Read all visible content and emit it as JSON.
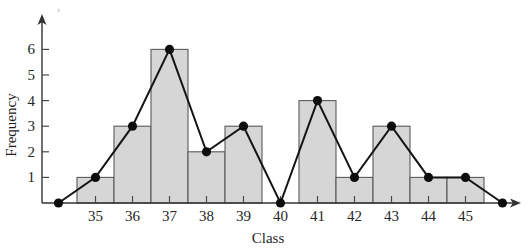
{
  "chart_data": {
    "type": "bar",
    "title": "",
    "xlabel": "Class",
    "ylabel": "Frequency",
    "categories": [
      "35",
      "36",
      "37",
      "38",
      "39",
      "40",
      "41",
      "42",
      "43",
      "44",
      "45"
    ],
    "values": [
      1,
      3,
      6,
      2,
      3,
      0,
      4,
      1,
      3,
      1,
      1
    ],
    "ylim": [
      0,
      7
    ],
    "yticks": [
      "1",
      "2",
      "3",
      "4",
      "5",
      "6"
    ],
    "ytick_values": [
      1,
      2,
      3,
      4,
      5,
      6
    ],
    "grid": false,
    "legend": null,
    "overlay": {
      "type": "line",
      "name": "frequency polygon",
      "x": [
        "34",
        "35",
        "36",
        "37",
        "38",
        "39",
        "40",
        "41",
        "42",
        "43",
        "44",
        "45",
        "46"
      ],
      "values": [
        0,
        1,
        3,
        6,
        2,
        3,
        0,
        4,
        1,
        3,
        1,
        1,
        0
      ],
      "markers": "filled-circle"
    },
    "style": {
      "bar_fill": "#d6d6d6",
      "bar_edge": "#5a5a5a",
      "line_color": "#141414",
      "marker_color": "#0d0d0d",
      "axis_color": "#333333",
      "text_color": "#262626",
      "background": "#ffffff"
    }
  },
  "axes": {
    "y_axis_name": "frequency-axis",
    "x_axis_name": "class-axis",
    "y_arrow": true,
    "x_arrow": true
  },
  "geometry": {
    "baseline_y": 203,
    "y_axis_x": 42,
    "unit_height": 25.6,
    "bar_width": 37,
    "first_bar_left": 77,
    "x_axis_end": 521,
    "y_axis_top": 14
  }
}
